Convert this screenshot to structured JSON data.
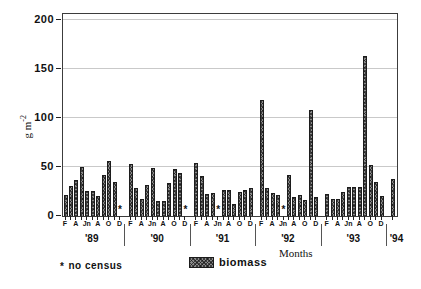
{
  "figure": {
    "y_axis": {
      "title_main": "g m",
      "title_sup": "-2",
      "ticks": [
        0,
        50,
        100,
        150,
        200
      ],
      "max": 200
    },
    "x_axis": {
      "title": "Months",
      "month_labels": [
        "F",
        "A",
        "Jn",
        "A",
        "O",
        "D"
      ]
    },
    "legend": {
      "label": "biomass"
    },
    "footnote": {
      "star": "*",
      "text": "no census"
    },
    "colors": {
      "bar_fill": "#8a8a8a",
      "bar_edge": "#1c1c1c",
      "gridline": "#c9c9c9",
      "frame": "#3c3c3c"
    }
  },
  "chart_data": {
    "type": "bar",
    "title": "",
    "xlabel": "Months",
    "ylabel": "g m-2",
    "ylim": [
      0,
      200
    ],
    "yticks": [
      0,
      50,
      100,
      150,
      200
    ],
    "grid": true,
    "legend_entries": [
      "biomass"
    ],
    "note": "* no census (null values)",
    "month_positions": [
      "F",
      "M",
      "A",
      "M",
      "Jn",
      "Jl",
      "A",
      "S",
      "O",
      "N",
      "D"
    ],
    "series": [
      {
        "year": "'89",
        "values": [
          21,
          31,
          37,
          50,
          26,
          26,
          20,
          42,
          56,
          35,
          null
        ]
      },
      {
        "year": "'90",
        "values": [
          53,
          29,
          17,
          32,
          49,
          15,
          15,
          34,
          48,
          44,
          null
        ]
      },
      {
        "year": "'91",
        "values": [
          54,
          41,
          22,
          23,
          null,
          27,
          27,
          12,
          24,
          27,
          29
        ]
      },
      {
        "year": "'92",
        "values": [
          118,
          29,
          23,
          21,
          null,
          42,
          19,
          21,
          16,
          108,
          19
        ]
      },
      {
        "year": "'93",
        "values": [
          22,
          17,
          17,
          24,
          30,
          30,
          30,
          163,
          52,
          35,
          20
        ]
      },
      {
        "year": "'94",
        "values": [
          38
        ]
      }
    ]
  }
}
